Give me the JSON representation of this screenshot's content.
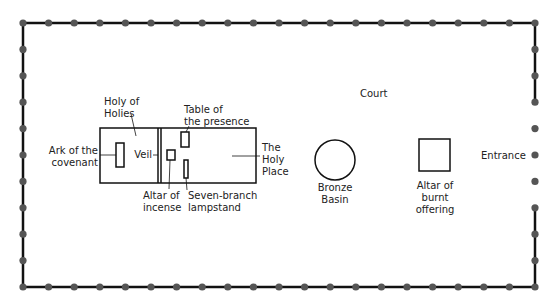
{
  "diagram": {
    "colors": {
      "wall": "#111111",
      "post": "#555555",
      "text": "#222222",
      "background": "#ffffff"
    },
    "court": {
      "label": "Court",
      "entrance_label": "Entrance",
      "bounds": {
        "left": 23,
        "top": 23,
        "right": 535,
        "bottom": 287
      },
      "posts_per_long_side": 21,
      "posts_per_short_side": 11
    },
    "tabernacle": {
      "holy_of_holies_label": [
        "Holy of",
        "Holies"
      ],
      "holy_place_label": [
        "The",
        "Holy",
        "Place"
      ],
      "veil_label": "Veil"
    },
    "furniture": {
      "ark": [
        "Ark of the",
        "covenant"
      ],
      "altar_incense": [
        "Altar of",
        "incense"
      ],
      "table": [
        "Table of",
        "the presence"
      ],
      "lampstand": [
        "Seven-branch",
        "lampstand"
      ],
      "bronze_basin": [
        "Bronze",
        "Basin"
      ],
      "altar_burnt": [
        "Altar of",
        "burnt",
        "offering"
      ]
    }
  }
}
